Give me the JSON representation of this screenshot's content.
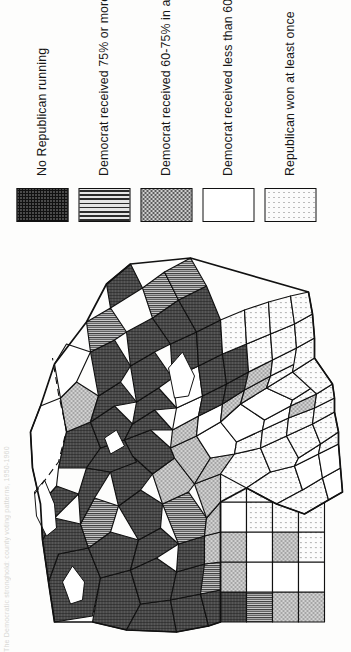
{
  "plate": {
    "caption": "The Democratic stronghold: county voting patterns, 1950-1960"
  },
  "legend": {
    "title": "",
    "items": [
      {
        "key": "no-republican-running",
        "label": "No Republican running",
        "pattern": "crosshatch",
        "color": "#4a4a4a"
      },
      {
        "key": "democrat-75-or-more",
        "label": "Democrat received 75% or more in all elections",
        "pattern": "vertical-lines",
        "color": "#7d7d7d"
      },
      {
        "key": "democrat-60-75",
        "label": "Democrat received 60-75% in at least one election",
        "pattern": "stipple-medium",
        "color": "#c4c4c4"
      },
      {
        "key": "democrat-under-60-always-won",
        "label": "Democrat received less than 60% in at least one election but always won",
        "pattern": "solid-white",
        "color": "#ffffff"
      },
      {
        "key": "republican-won-at-least-once",
        "label": "Republican won at least once",
        "pattern": "dots-light",
        "color": "#efefef"
      }
    ]
  },
  "map": {
    "name": "county-choropleth-map",
    "stroke_color": "#111111",
    "background": "#ffffff"
  }
}
